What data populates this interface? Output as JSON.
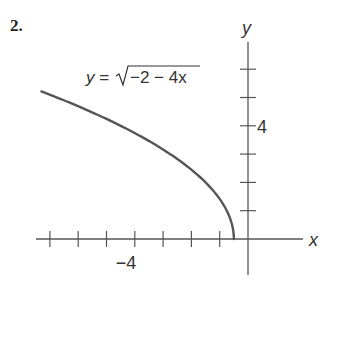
{
  "problem_number": "2.",
  "chart_data": {
    "type": "line",
    "title": "",
    "equation_label": "y = √(−2 − 4x)",
    "equation": {
      "prefix": "y =",
      "radicand": "−2 − 4x"
    },
    "xlabel": "x",
    "ylabel": "y",
    "x_tick_labels": [
      {
        "value": -4,
        "label": "−4"
      }
    ],
    "y_tick_labels": [
      {
        "value": 4,
        "label": "4"
      }
    ],
    "x_ticks": [
      -7,
      -6,
      -5,
      -4,
      -3,
      -2,
      -1
    ],
    "y_ticks": [
      1,
      2,
      3,
      4,
      5,
      6
    ],
    "xlim": [
      -7.3,
      2.2
    ],
    "ylim": [
      -2,
      7.5
    ],
    "grid": false,
    "series": [
      {
        "name": "y = sqrt(-2 - 4x)",
        "x": [
          -7.3,
          -7,
          -6,
          -5,
          -4,
          -3,
          -2,
          -1,
          -0.75,
          -0.6,
          -0.5
        ],
        "y": [
          5.19,
          5.1,
          4.69,
          4.24,
          3.74,
          3.16,
          2.45,
          1.41,
          1.0,
          0.63,
          0
        ]
      }
    ],
    "color": "#555555"
  }
}
